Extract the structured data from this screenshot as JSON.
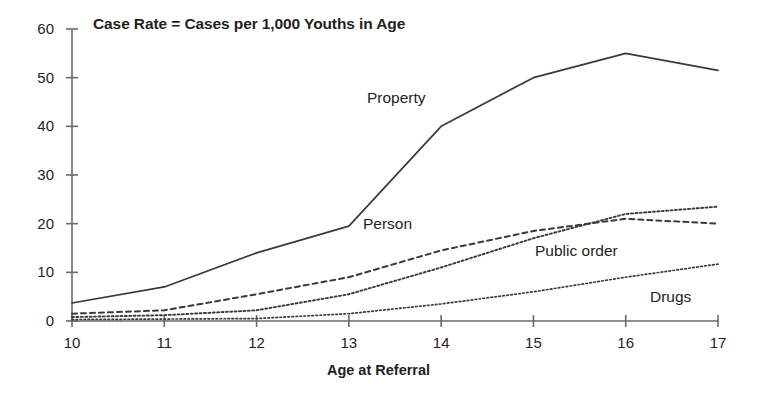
{
  "chart_data": {
    "type": "line",
    "title": "Case Rate = Cases per 1,000 Youths in Age",
    "xlabel": "Age at Referral",
    "ylabel": "",
    "categories": [
      10,
      11,
      12,
      13,
      14,
      15,
      16,
      17
    ],
    "x_tick_labels": [
      "10",
      "11",
      "12",
      "13",
      "14",
      "15",
      "16",
      "17"
    ],
    "y_tick_labels": [
      "0",
      "10",
      "20",
      "30",
      "40",
      "50",
      "60"
    ],
    "y_ticks": [
      0,
      10,
      20,
      30,
      40,
      50,
      60
    ],
    "xlim": [
      10,
      17
    ],
    "ylim": [
      0,
      60
    ],
    "grid": false,
    "legend": "inline-labels",
    "series": [
      {
        "name": "Property",
        "label": "Property",
        "style": "solid",
        "color": "#3a3a3a",
        "values": [
          3.7,
          7.0,
          14.0,
          19.5,
          40.0,
          50.0,
          55.0,
          51.5
        ]
      },
      {
        "name": "Person",
        "label": "Person",
        "style": "dashed",
        "color": "#3a3a3a",
        "values": [
          1.5,
          2.2,
          5.5,
          9.0,
          14.5,
          18.5,
          21.0,
          20.0
        ]
      },
      {
        "name": "Public order",
        "label": "Public order",
        "style": "dotted",
        "color": "#3a3a3a",
        "values": [
          0.8,
          1.2,
          2.2,
          5.5,
          11.0,
          17.0,
          22.0,
          23.5
        ]
      },
      {
        "name": "Drugs",
        "label": "Drugs",
        "style": "fine-dotted",
        "color": "#3a3a3a",
        "values": [
          0.3,
          0.4,
          0.5,
          1.5,
          3.5,
          6.0,
          9.0,
          11.7
        ]
      }
    ],
    "annotations": [
      {
        "text": "Property",
        "x": 367,
        "y": 90
      },
      {
        "text": "Person",
        "x": 363,
        "y": 216
      },
      {
        "text": "Public order",
        "x": 535,
        "y": 243
      },
      {
        "text": "Drugs",
        "x": 650,
        "y": 289
      }
    ]
  }
}
